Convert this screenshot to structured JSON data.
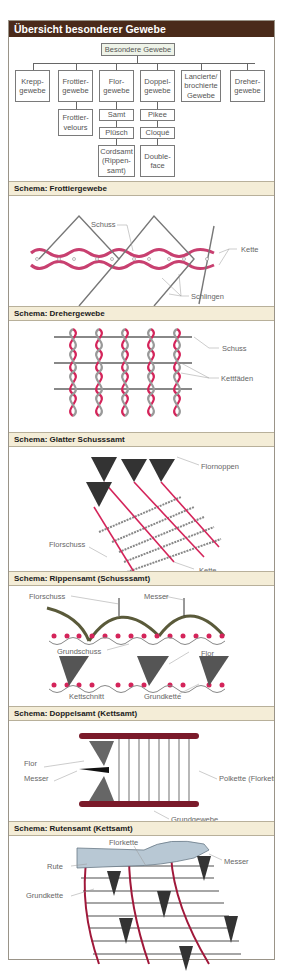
{
  "title": "Übersicht besonderer Gewebe",
  "tree": {
    "root": "Besondere Gewebe",
    "children": [
      {
        "label": "Krepp-\ngewebe"
      },
      {
        "label": "Frottier-\ngewebe",
        "sub": [
          "Frottier-\nvelours"
        ]
      },
      {
        "label": "Flor-\ngewebe",
        "sub": [
          "Samt",
          "Plüsch",
          "Cordsamt\n(Rippen-\nsamt)"
        ]
      },
      {
        "label": "Doppel-\ngewebe",
        "sub": [
          "Pikee",
          "Cloqué",
          "Double-\nface"
        ]
      },
      {
        "label": "Lancierte/\nbrochierte\nGewebe"
      },
      {
        "label": "Dreher-\ngewebe"
      }
    ]
  },
  "sections": [
    {
      "title": "Schema: Frottiergewebe",
      "labels": [
        "Schuss",
        "Kette",
        "Schlingen"
      ]
    },
    {
      "title": "Schema: Drehergewebe",
      "labels": [
        "Schuss",
        "Kettfäden"
      ]
    },
    {
      "title": "Schema: Glatter Schusssamt",
      "labels": [
        "Flornoppen",
        "Florschuss",
        "Grundschuss",
        "Kette"
      ]
    },
    {
      "title": "Schema: Rippensamt (Schusssamt)",
      "labels": [
        "Florschuss",
        "Messer",
        "Grundschuss",
        "Flor",
        "Kettschnitt",
        "Grundkette"
      ]
    },
    {
      "title": "Schema: Doppelsamt (Kettsamt)",
      "labels": [
        "Flor",
        "Messer",
        "Polkette\n(Florkette)",
        "Grundgewebe"
      ]
    },
    {
      "title": "Schema: Rutensamt (Kettsamt)",
      "labels": [
        "Florkette",
        "Messer",
        "Rute",
        "Grundkette"
      ]
    }
  ],
  "colors": {
    "header": "#4a2a1a",
    "section_bg": "#f4edd7",
    "warp_red": "#d4245a",
    "pile_dark": "#2a2a2a",
    "olive": "#5a5a3a"
  }
}
